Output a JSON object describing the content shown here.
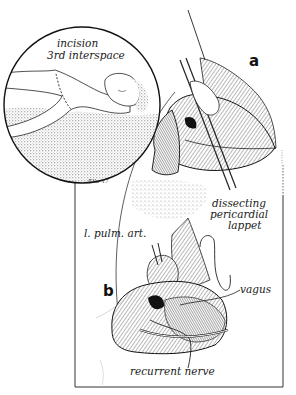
{
  "figure": {
    "inset": {
      "label_line1": "incision",
      "label_line2": "3rd interspace",
      "signature": "F.Ilu '17"
    },
    "panel_a": {
      "letter": "a",
      "labels": {
        "lappet_line1": "dissecting",
        "lappet_line2": "pericardial",
        "lappet_line3": "lappet"
      }
    },
    "panel_b": {
      "letter": "b",
      "labels": {
        "pulm_art": "l. pulm. art.",
        "vagus": "vagus",
        "recurrent_nerve": "recurrent nerve"
      }
    },
    "colors": {
      "ink": "#1a1a1a",
      "paper": "#ffffff",
      "stipple": "#9a9a9a"
    }
  }
}
